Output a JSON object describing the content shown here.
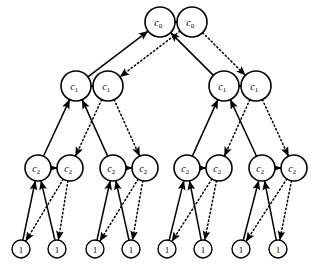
{
  "diagram": {
    "type": "directed-graph",
    "background_color": "#ffffff",
    "stroke_color": "#000000",
    "levels": [
      {
        "level": 0,
        "label": "c_0",
        "label_base": "c",
        "label_sub": "0",
        "node_radius": 15,
        "center_y": 22,
        "pairs": [
          {
            "pair_index": 0,
            "left_cx": 160,
            "right_cx": 192
          }
        ]
      },
      {
        "level": 1,
        "label": "c_1",
        "label_base": "c",
        "label_sub": "1",
        "node_radius": 15,
        "center_y": 86,
        "pairs": [
          {
            "pair_index": 0,
            "left_cx": 76,
            "right_cx": 108
          },
          {
            "pair_index": 1,
            "left_cx": 224,
            "right_cx": 256
          }
        ]
      },
      {
        "level": 2,
        "label": "c_2",
        "label_base": "c",
        "label_sub": "2",
        "node_radius": 13,
        "center_y": 168,
        "pairs": [
          {
            "pair_index": 0,
            "left_cx": 38,
            "right_cx": 70
          },
          {
            "pair_index": 1,
            "left_cx": 113,
            "right_cx": 145
          },
          {
            "pair_index": 2,
            "left_cx": 187,
            "right_cx": 219
          },
          {
            "pair_index": 3,
            "left_cx": 262,
            "right_cx": 294
          }
        ]
      },
      {
        "level": 3,
        "label": "1",
        "label_base": "1",
        "label_sub": "",
        "node_radius": 9,
        "center_y": 249,
        "leaves": [
          {
            "leaf_index": 0,
            "cx": 21
          },
          {
            "leaf_index": 1,
            "cx": 57
          },
          {
            "leaf_index": 2,
            "cx": 95
          },
          {
            "leaf_index": 3,
            "cx": 131
          },
          {
            "leaf_index": 4,
            "cx": 167
          },
          {
            "leaf_index": 5,
            "cx": 203
          },
          {
            "leaf_index": 6,
            "cx": 241
          },
          {
            "leaf_index": 7,
            "cx": 278
          }
        ]
      }
    ],
    "edge_styles": {
      "pair_link": "solid-arrow",
      "child_to_parent": "solid-arrow-up",
      "parent_to_child": "dotted-arrow-down"
    },
    "legend_note": "",
    "node_labels": {
      "root": "c0",
      "level1": "c1",
      "level2": "c2",
      "leaf": "1"
    }
  }
}
